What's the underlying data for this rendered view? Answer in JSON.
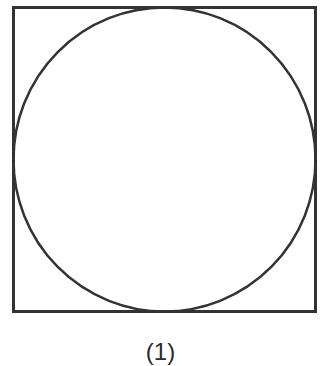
{
  "figure": {
    "caption": "(1)",
    "shapes": [
      {
        "type": "square",
        "x": 13,
        "y": 7,
        "width": 303,
        "height": 305
      },
      {
        "type": "circle",
        "cx": 164.5,
        "cy": 159.5,
        "r": 151.5,
        "inscribed_in": "square"
      }
    ],
    "stroke_color": "#333333",
    "background_color": "#ffffff"
  }
}
